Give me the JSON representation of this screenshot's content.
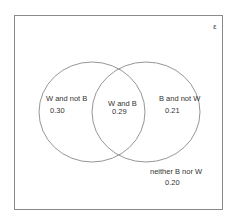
{
  "diagram": {
    "type": "venn",
    "universe_label": "ε",
    "colors": {
      "stroke": "#8a8a8a",
      "text": "#333333",
      "background": "#ffffff"
    },
    "sets": [
      {
        "name": "W",
        "cx": 92,
        "cy": 112,
        "rx": 53,
        "ry": 50
      },
      {
        "name": "B",
        "cx": 146,
        "cy": 112,
        "rx": 54,
        "ry": 50
      }
    ],
    "regions": {
      "w_not_b": {
        "label": "W and not B",
        "value": "0.30"
      },
      "w_and_b": {
        "label": "W and B",
        "value": "0.29"
      },
      "b_not_w": {
        "label": "B and not W",
        "value": "0.21"
      },
      "neither": {
        "label": "neither B nor W",
        "value": "0.20"
      }
    }
  }
}
